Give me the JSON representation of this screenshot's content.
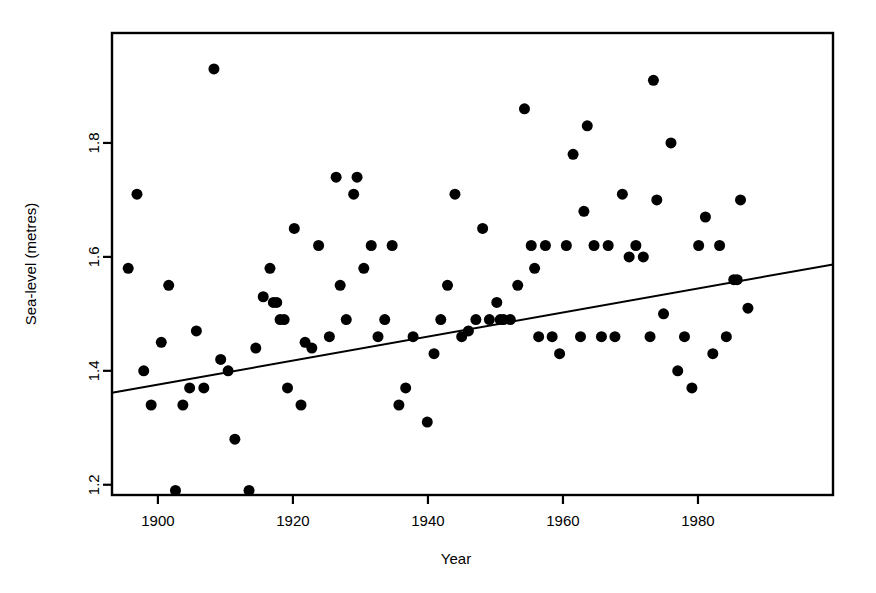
{
  "figure": {
    "width": 876,
    "height": 593,
    "background": "#ffffff",
    "foreground": "#000000"
  },
  "chart_data": {
    "type": "scatter",
    "title": "",
    "xlabel": "Year",
    "ylabel": "Sea-level (metres)",
    "xlim": [
      1893.2,
      2000.0
    ],
    "ylim": [
      1.182,
      1.993
    ],
    "xticks": [
      1900,
      1920,
      1940,
      1960,
      1980
    ],
    "xtick_labels": [
      "1900",
      "1920",
      "1940",
      "1960",
      "1980"
    ],
    "yticks": [
      1.2,
      1.4,
      1.6,
      1.8
    ],
    "ytick_labels": [
      "1.2",
      "1.4",
      "1.6",
      "1.8"
    ],
    "grid": false,
    "legend": null,
    "marker": {
      "shape": "circle",
      "color": "#000000",
      "size": 5.5
    },
    "series": [
      {
        "name": "Sea-level observations",
        "points": [
          [
            1895.6,
            1.58
          ],
          [
            1896.9,
            1.71
          ],
          [
            1897.9,
            1.4
          ],
          [
            1899.0,
            1.34
          ],
          [
            1900.5,
            1.45
          ],
          [
            1901.6,
            1.55
          ],
          [
            1902.6,
            1.19
          ],
          [
            1903.7,
            1.34
          ],
          [
            1904.7,
            1.37
          ],
          [
            1905.7,
            1.47
          ],
          [
            1906.8,
            1.37
          ],
          [
            1908.3,
            1.93
          ],
          [
            1909.3,
            1.42
          ],
          [
            1910.4,
            1.4
          ],
          [
            1911.4,
            1.28
          ],
          [
            1913.5,
            1.19
          ],
          [
            1914.5,
            1.44
          ],
          [
            1915.6,
            1.53
          ],
          [
            1916.6,
            1.58
          ],
          [
            1917.1,
            1.52
          ],
          [
            1917.6,
            1.52
          ],
          [
            1918.1,
            1.49
          ],
          [
            1918.7,
            1.49
          ],
          [
            1919.2,
            1.37
          ],
          [
            1920.2,
            1.65
          ],
          [
            1921.2,
            1.34
          ],
          [
            1921.8,
            1.45
          ],
          [
            1922.8,
            1.44
          ],
          [
            1923.8,
            1.62
          ],
          [
            1925.4,
            1.46
          ],
          [
            1926.4,
            1.74
          ],
          [
            1927.0,
            1.55
          ],
          [
            1927.9,
            1.49
          ],
          [
            1929.0,
            1.71
          ],
          [
            1929.5,
            1.74
          ],
          [
            1930.5,
            1.58
          ],
          [
            1931.6,
            1.62
          ],
          [
            1932.6,
            1.46
          ],
          [
            1933.6,
            1.49
          ],
          [
            1934.7,
            1.62
          ],
          [
            1935.7,
            1.34
          ],
          [
            1936.7,
            1.37
          ],
          [
            1937.8,
            1.46
          ],
          [
            1939.9,
            1.31
          ],
          [
            1940.9,
            1.43
          ],
          [
            1941.9,
            1.49
          ],
          [
            1942.9,
            1.55
          ],
          [
            1944.0,
            1.71
          ],
          [
            1945.0,
            1.46
          ],
          [
            1946.0,
            1.47
          ],
          [
            1947.1,
            1.49
          ],
          [
            1948.1,
            1.65
          ],
          [
            1949.1,
            1.49
          ],
          [
            1950.2,
            1.52
          ],
          [
            1950.7,
            1.49
          ],
          [
            1951.2,
            1.49
          ],
          [
            1952.2,
            1.49
          ],
          [
            1953.3,
            1.55
          ],
          [
            1954.3,
            1.86
          ],
          [
            1955.3,
            1.62
          ],
          [
            1955.8,
            1.58
          ],
          [
            1956.4,
            1.46
          ],
          [
            1957.4,
            1.62
          ],
          [
            1958.4,
            1.46
          ],
          [
            1959.5,
            1.43
          ],
          [
            1960.5,
            1.62
          ],
          [
            1961.5,
            1.78
          ],
          [
            1962.6,
            1.46
          ],
          [
            1963.1,
            1.68
          ],
          [
            1963.6,
            1.83
          ],
          [
            1964.6,
            1.62
          ],
          [
            1965.7,
            1.46
          ],
          [
            1966.7,
            1.62
          ],
          [
            1967.7,
            1.46
          ],
          [
            1968.8,
            1.71
          ],
          [
            1969.8,
            1.6
          ],
          [
            1970.8,
            1.62
          ],
          [
            1971.9,
            1.6
          ],
          [
            1972.9,
            1.46
          ],
          [
            1973.4,
            1.91
          ],
          [
            1973.9,
            1.7
          ],
          [
            1974.9,
            1.5
          ],
          [
            1976.0,
            1.8
          ],
          [
            1977.0,
            1.4
          ],
          [
            1978.0,
            1.46
          ],
          [
            1979.1,
            1.37
          ],
          [
            1980.1,
            1.62
          ],
          [
            1981.1,
            1.67
          ],
          [
            1982.2,
            1.43
          ],
          [
            1983.2,
            1.62
          ],
          [
            1984.2,
            1.46
          ],
          [
            1985.3,
            1.56
          ],
          [
            1985.8,
            1.56
          ],
          [
            1986.3,
            1.7
          ],
          [
            1987.4,
            1.51
          ]
        ]
      }
    ],
    "trend_line": {
      "name": "Linear regression fit",
      "color": "#000000",
      "width": 2,
      "x_start": 1893.2,
      "y_start": 1.3613,
      "x_end": 2000.0,
      "y_end": 1.5867
    }
  }
}
